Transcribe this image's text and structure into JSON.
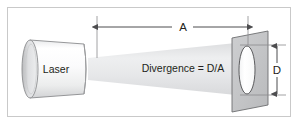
{
  "figure": {
    "frame_color": "#c9c9c9",
    "background_color": "#ffffff"
  },
  "labels": {
    "laser": "Laser",
    "divergence_formula": "Divergence = D/A",
    "distance_dimension": "A",
    "diameter_dimension": "D"
  },
  "elements": {
    "laser_body_name": "laser cylinder",
    "beam_name": "diverging laser beam cone",
    "target_name": "target plane",
    "spot_name": "beam spot ellipse"
  },
  "colors": {
    "outline": "#6d6e71",
    "laser_fill_light": "#ffffff",
    "laser_fill_dark": "#c4c5c7",
    "beam_fill": "#e3e4e6",
    "target_fill": "#c8c9cb",
    "spot_fill": "#ffffff",
    "dimension_line": "#4d4d4f",
    "text": "#231f20"
  }
}
